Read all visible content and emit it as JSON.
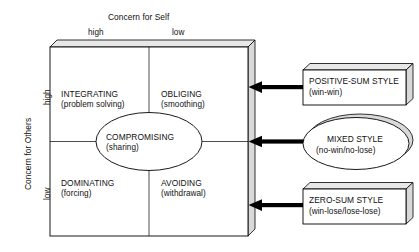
{
  "diagram": {
    "title_top_axis": "Concern for Self",
    "title_left_axis": "Concern for Others",
    "top_ticks": {
      "high": "high",
      "low": "low"
    },
    "left_ticks": {
      "high": "high",
      "low": "low"
    },
    "quadrants": [
      {
        "id": "integrating",
        "label": "INTEGRATING",
        "sub": "(problem solving)"
      },
      {
        "id": "obliging",
        "label": "OBLIGING",
        "sub": "(smoothing)"
      },
      {
        "id": "dominating",
        "label": "DOMINATING",
        "sub": "(forcing)"
      },
      {
        "id": "avoiding",
        "label": "AVOIDING",
        "sub": "(withdrawal)"
      }
    ],
    "center": {
      "id": "compromising",
      "label": "COMPROMISING",
      "sub": "(sharing)"
    },
    "callouts": [
      {
        "id": "positive-sum",
        "shape": "box",
        "label": "POSITIVE-SUM STYLE",
        "sub": "(win-win)"
      },
      {
        "id": "mixed",
        "shape": "ellipse",
        "label": "MIXED STYLE",
        "sub": "(no-win/no-lose)"
      },
      {
        "id": "zero-sum",
        "shape": "box",
        "label": "ZERO-SUM STYLE",
        "sub": "(win-lose/lose-lose)"
      }
    ],
    "arrows": [
      {
        "id": "arrow-positive-sum",
        "direction": "left"
      },
      {
        "id": "arrow-mixed",
        "direction": "left"
      },
      {
        "id": "arrow-zero-sum",
        "direction": "left"
      }
    ],
    "colors": {
      "stroke": "#000000",
      "face": "#ffffff",
      "side_shade": "#d9d9d9",
      "top_shade": "#e8e8e8",
      "arrow": "#000000",
      "text": "#111111"
    }
  }
}
